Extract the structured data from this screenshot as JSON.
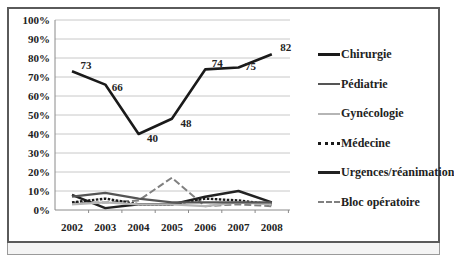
{
  "chart_data": {
    "type": "line",
    "title": "",
    "xlabel": "",
    "ylabel": "",
    "x": [
      "2002",
      "2003",
      "2004",
      "2005",
      "2006",
      "2007",
      "2008"
    ],
    "y_ticks": [
      "0%",
      "10%",
      "20%",
      "30%",
      "40%",
      "50%",
      "60%",
      "70%",
      "80%",
      "90%",
      "100%"
    ],
    "ylim": [
      0,
      100
    ],
    "grid": true,
    "legend_position": "right",
    "series": [
      {
        "name": "Chirurgie",
        "values": [
          73,
          66,
          40,
          48,
          74,
          75,
          82
        ],
        "color": "#1a1a1a",
        "style": "solid",
        "width": 2.6,
        "labels": [
          "73",
          "66",
          "40",
          "48",
          "74",
          "75",
          "82"
        ]
      },
      {
        "name": "Pédiatrie",
        "values": [
          7,
          9,
          6,
          4,
          4,
          4,
          4
        ],
        "color": "#555555",
        "style": "solid",
        "width": 2.2
      },
      {
        "name": "Gynécologie",
        "values": [
          3,
          4,
          3,
          3,
          2,
          4,
          3
        ],
        "color": "#b5b5b5",
        "style": "solid",
        "width": 2.2
      },
      {
        "name": "Médecine",
        "values": [
          4,
          6,
          3,
          3,
          6,
          5,
          3
        ],
        "color": "#1a1a1a",
        "style": "dotted",
        "width": 2.4
      },
      {
        "name": "Urgences/réanimation",
        "values": [
          8,
          1,
          3,
          3,
          7,
          10,
          4
        ],
        "color": "#222222",
        "style": "solid",
        "width": 2.4
      },
      {
        "name": "Bloc opératoire",
        "values": [
          4,
          4,
          5,
          17,
          2,
          3,
          2
        ],
        "color": "#808080",
        "style": "dashed",
        "width": 2.0
      }
    ]
  }
}
